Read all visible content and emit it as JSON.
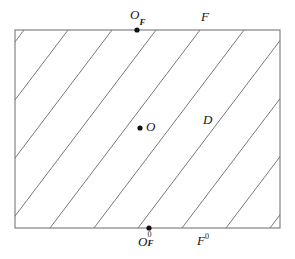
{
  "figure": {
    "background_color": "#ffffff",
    "stroke_color": "#595959",
    "border_color": "#6b6b6b",
    "point_color": "#111111",
    "labels": {
      "top_point": "O",
      "top_point_sub": "F",
      "top_line": "F",
      "center_point": "O",
      "region": "D",
      "bottom_point": "O",
      "bottom_point_sub": "F",
      "bottom_point_sup": "0",
      "bottom_line": "F",
      "bottom_line_sup": "0"
    },
    "geometry": {
      "rect": {
        "x": 15,
        "y": 30,
        "width": 265,
        "height": 198
      },
      "line_slope_run": 150,
      "line_spacing": 44,
      "lines_bottom_x": [
        18,
        62,
        106,
        149,
        193,
        237,
        281
      ],
      "points": [
        {
          "name": "O_F",
          "x": 137,
          "y": 30
        },
        {
          "name": "O",
          "x": 140,
          "y": 128
        },
        {
          "name": "O_F^0",
          "x": 149,
          "y": 228
        }
      ]
    }
  }
}
